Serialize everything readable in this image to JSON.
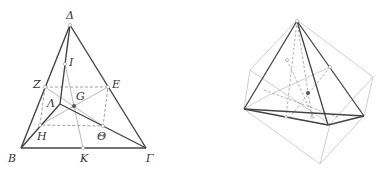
{
  "figure_left": {
    "title": "Tetrahedron with midpoint parallelogram",
    "labels": {
      "delta": "Δ",
      "iota": "I",
      "zeta": "Z",
      "epsilon": "E",
      "lambda": "Λ",
      "g": "G",
      "eta": "H",
      "theta": "Θ",
      "beta": "B",
      "kappa": "K",
      "gamma": "Γ"
    }
  },
  "figure_right": {
    "title": "Tetrahedron inscribed in cube"
  },
  "colors": {
    "edge": "#444444",
    "hidden": "#888888",
    "light": "#bbbbbb",
    "cube": "#c8c8c8",
    "point": "#555555"
  }
}
